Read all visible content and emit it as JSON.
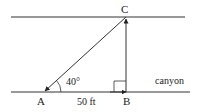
{
  "diagram": {
    "points": {
      "A": {
        "label": "A",
        "x": 44,
        "y": 92
      },
      "B": {
        "label": "B",
        "x": 126,
        "y": 92
      },
      "C": {
        "label": "C",
        "x": 126,
        "y": 17
      }
    },
    "angle_label": "40°",
    "distance_label": "50 ft",
    "region_label": "canyon",
    "colors": {
      "line": "#333333",
      "text": "#222222"
    }
  }
}
